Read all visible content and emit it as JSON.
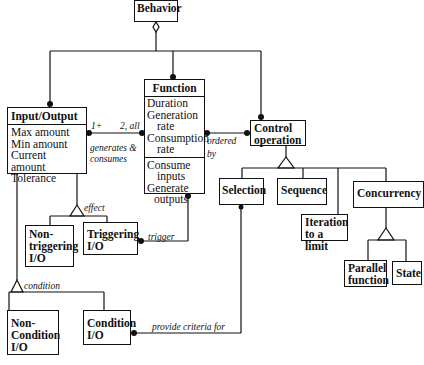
{
  "classes": {
    "behavior": {
      "name": "Behavior"
    },
    "input_output": {
      "name": "Input/Output",
      "attributes": [
        "Max amount",
        "Min amount",
        "Current amount",
        "Tolerance"
      ]
    },
    "function": {
      "name": "Function",
      "attributes": [
        "Duration",
        "Generation",
        "rate",
        "Consumption",
        "rate"
      ],
      "operations": [
        "Consume",
        "inputs",
        "Generate",
        "outputs"
      ]
    },
    "control_operation": {
      "name_line1": "Control",
      "name_line2": "operation"
    },
    "non_triggering_io": {
      "line1": "Non-",
      "line2": "triggering",
      "line3": "I/O"
    },
    "triggering_io": {
      "line1": "Triggering",
      "line2": "I/O"
    },
    "non_condition_io": {
      "line1": "Non-",
      "line2": "Condition",
      "line3": "I/O"
    },
    "condition_io": {
      "line1": "Condition",
      "line2": "I/O"
    },
    "selection": {
      "name": "Selection"
    },
    "sequence": {
      "name": "Sequence"
    },
    "iteration": {
      "line1": "Iteration",
      "line2": "to a limit"
    },
    "concurrency": {
      "name": "Concurrency"
    },
    "parallel_function": {
      "line1": "Parallel",
      "line2": "function"
    },
    "state": {
      "name": "State"
    }
  },
  "associations": {
    "generates_consumes": {
      "line1": "generates &",
      "line2": "consumes",
      "mult_io": "1+",
      "mult_fn": "2, all"
    },
    "ordered_by": {
      "line1": "ordered",
      "line2": "by"
    },
    "effect": "effect",
    "trigger": "trigger",
    "condition": "condition",
    "provide_criteria": "provide criteria for"
  }
}
